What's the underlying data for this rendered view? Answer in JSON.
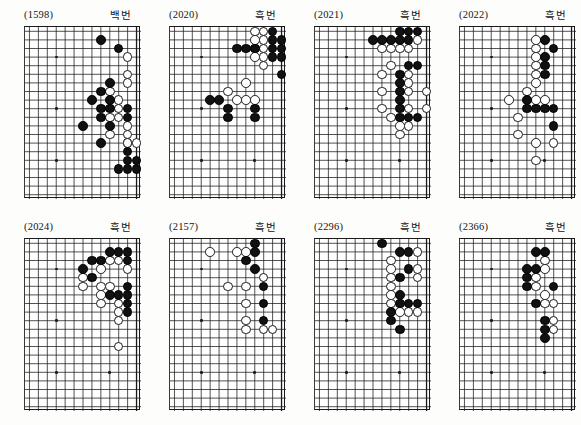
{
  "page": {
    "background_color": "#fdfdfc",
    "black_stone_color": "#111111",
    "white_stone_color": "#ffffff",
    "line_color": "#1a1a1a",
    "columns": 4,
    "rows": 2
  },
  "board_spec": {
    "cols": 13,
    "rows": 20,
    "cell_px": 8.92,
    "stone_diameter_px": 9.6,
    "note": "Right-side fragment of a 19x19 go board; column 13 is the right edge line."
  },
  "panels": [
    {
      "id": "(1598)",
      "turn": "백번",
      "turn_meaning": "white-to-play",
      "star_points": [
        [
          3,
          3
        ],
        [
          3,
          9
        ],
        [
          3,
          15
        ]
      ],
      "black": [
        [
          8,
          1
        ],
        [
          10,
          2
        ],
        [
          9,
          6
        ],
        [
          8,
          7
        ],
        [
          7,
          8
        ],
        [
          9,
          8
        ],
        [
          8,
          9
        ],
        [
          9,
          9
        ],
        [
          11,
          9
        ],
        [
          8,
          10
        ],
        [
          11,
          10
        ],
        [
          6,
          11
        ],
        [
          9,
          11
        ],
        [
          8,
          13
        ],
        [
          11,
          14
        ],
        [
          11,
          15
        ],
        [
          12,
          15
        ],
        [
          10,
          16
        ],
        [
          11,
          16
        ],
        [
          12,
          16
        ]
      ],
      "white": [
        [
          11,
          3
        ],
        [
          11,
          5
        ],
        [
          11,
          6
        ],
        [
          9,
          7
        ],
        [
          10,
          8
        ],
        [
          10,
          9
        ],
        [
          9,
          10
        ],
        [
          10,
          10
        ],
        [
          11,
          11
        ],
        [
          9,
          12
        ],
        [
          11,
          12
        ],
        [
          11,
          13
        ],
        [
          12,
          13
        ],
        [
          11,
          13
        ]
      ]
    },
    {
      "id": "(2020)",
      "turn": "흑번",
      "turn_meaning": "black-to-play",
      "star_points": [
        [
          3,
          3
        ],
        [
          3,
          9
        ],
        [
          3,
          15
        ],
        [
          9,
          15
        ]
      ],
      "black": [
        [
          11,
          0
        ],
        [
          11,
          1
        ],
        [
          12,
          1
        ],
        [
          7,
          2
        ],
        [
          8,
          2
        ],
        [
          9,
          2
        ],
        [
          11,
          2
        ],
        [
          12,
          2
        ],
        [
          11,
          3
        ],
        [
          12,
          3
        ],
        [
          12,
          5
        ],
        [
          4,
          8
        ],
        [
          5,
          8
        ],
        [
          6,
          9
        ],
        [
          6,
          10
        ],
        [
          9,
          9
        ],
        [
          9,
          10
        ]
      ],
      "white": [
        [
          9,
          0
        ],
        [
          10,
          0
        ],
        [
          9,
          1
        ],
        [
          10,
          1
        ],
        [
          9,
          2
        ],
        [
          10,
          2
        ],
        [
          9,
          3
        ],
        [
          10,
          3
        ],
        [
          10,
          4
        ],
        [
          8,
          6
        ],
        [
          6,
          7
        ],
        [
          7,
          8
        ],
        [
          8,
          8
        ],
        [
          9,
          8
        ]
      ]
    },
    {
      "id": "(2021)",
      "turn": "흑번",
      "turn_meaning": "black-to-play",
      "star_points": [
        [
          3,
          3
        ],
        [
          3,
          9
        ],
        [
          3,
          15
        ],
        [
          9,
          15
        ]
      ],
      "black": [
        [
          9,
          0
        ],
        [
          10,
          0
        ],
        [
          11,
          0
        ],
        [
          6,
          1
        ],
        [
          7,
          1
        ],
        [
          8,
          1
        ],
        [
          9,
          1
        ],
        [
          10,
          1
        ],
        [
          10,
          4
        ],
        [
          11,
          4
        ],
        [
          9,
          5
        ],
        [
          9,
          6
        ],
        [
          9,
          7
        ],
        [
          9,
          8
        ],
        [
          9,
          9
        ],
        [
          9,
          10
        ],
        [
          10,
          10
        ],
        [
          11,
          10
        ]
      ],
      "white": [
        [
          11,
          1
        ],
        [
          7,
          2
        ],
        [
          8,
          2
        ],
        [
          9,
          2
        ],
        [
          10,
          2
        ],
        [
          8,
          4
        ],
        [
          7,
          5
        ],
        [
          10,
          5
        ],
        [
          10,
          6
        ],
        [
          7,
          7
        ],
        [
          10,
          7
        ],
        [
          12,
          7
        ],
        [
          7,
          9
        ],
        [
          10,
          9
        ],
        [
          12,
          9
        ],
        [
          8,
          10
        ],
        [
          9,
          11
        ],
        [
          10,
          11
        ],
        [
          9,
          12
        ]
      ]
    },
    {
      "id": "(2022)",
      "turn": "흑번",
      "turn_meaning": "black-to-play",
      "star_points": [
        [
          3,
          3
        ],
        [
          3,
          9
        ],
        [
          3,
          15
        ],
        [
          9,
          15
        ]
      ],
      "black": [
        [
          9,
          1
        ],
        [
          10,
          2
        ],
        [
          9,
          3
        ],
        [
          9,
          4
        ],
        [
          9,
          5
        ],
        [
          7,
          8
        ],
        [
          7,
          9
        ],
        [
          8,
          9
        ],
        [
          9,
          9
        ],
        [
          10,
          9
        ],
        [
          10,
          11
        ]
      ],
      "white": [
        [
          8,
          1
        ],
        [
          8,
          2
        ],
        [
          8,
          3
        ],
        [
          8,
          4
        ],
        [
          8,
          5
        ],
        [
          8,
          6
        ],
        [
          7,
          7
        ],
        [
          5,
          8
        ],
        [
          8,
          8
        ],
        [
          9,
          8
        ],
        [
          6,
          10
        ],
        [
          6,
          12
        ],
        [
          8,
          13
        ],
        [
          10,
          13
        ],
        [
          8,
          15
        ]
      ]
    },
    {
      "id": "(2024)",
      "turn": "흑번",
      "turn_meaning": "black-to-play",
      "star_points": [
        [
          3,
          3
        ],
        [
          3,
          9
        ],
        [
          3,
          15
        ],
        [
          9,
          15
        ]
      ],
      "black": [
        [
          9,
          1
        ],
        [
          10,
          1
        ],
        [
          11,
          1
        ],
        [
          7,
          2
        ],
        [
          8,
          2
        ],
        [
          11,
          2
        ],
        [
          6,
          3
        ],
        [
          7,
          4
        ],
        [
          11,
          5
        ],
        [
          9,
          6
        ],
        [
          10,
          6
        ],
        [
          11,
          6
        ],
        [
          11,
          7
        ],
        [
          11,
          8
        ]
      ],
      "white": [
        [
          9,
          2
        ],
        [
          6,
          4
        ],
        [
          8,
          3
        ],
        [
          10,
          2
        ],
        [
          11,
          3
        ],
        [
          6,
          5
        ],
        [
          8,
          5
        ],
        [
          9,
          5
        ],
        [
          8,
          6
        ],
        [
          8,
          7
        ],
        [
          10,
          7
        ],
        [
          10,
          8
        ],
        [
          10,
          9
        ],
        [
          10,
          12
        ]
      ]
    },
    {
      "id": "(2157)",
      "turn": "흑번",
      "turn_meaning": "black-to-play",
      "star_points": [
        [
          3,
          3
        ],
        [
          3,
          9
        ],
        [
          3,
          15
        ],
        [
          9,
          15
        ]
      ],
      "black": [
        [
          9,
          0
        ],
        [
          9,
          1
        ],
        [
          8,
          2
        ],
        [
          9,
          3
        ],
        [
          10,
          5
        ],
        [
          10,
          7
        ],
        [
          10,
          9
        ]
      ],
      "white": [
        [
          4,
          1
        ],
        [
          7,
          1
        ],
        [
          8,
          1
        ],
        [
          6,
          5
        ],
        [
          8,
          5
        ],
        [
          10,
          4
        ],
        [
          8,
          7
        ],
        [
          8,
          9
        ],
        [
          8,
          10
        ],
        [
          10,
          10
        ],
        [
          11,
          10
        ]
      ]
    },
    {
      "id": "(2296)",
      "turn": "흑번",
      "turn_meaning": "black-to-play",
      "star_points": [
        [
          3,
          3
        ],
        [
          3,
          9
        ],
        [
          3,
          15
        ],
        [
          9,
          15
        ]
      ],
      "black": [
        [
          7,
          0
        ],
        [
          9,
          1
        ],
        [
          10,
          1
        ],
        [
          10,
          3
        ],
        [
          9,
          4
        ],
        [
          9,
          6
        ],
        [
          9,
          7
        ],
        [
          10,
          7
        ],
        [
          11,
          7
        ],
        [
          8,
          8
        ],
        [
          8,
          9
        ],
        [
          9,
          10
        ]
      ],
      "white": [
        [
          11,
          1
        ],
        [
          8,
          2
        ],
        [
          8,
          3
        ],
        [
          11,
          3
        ],
        [
          8,
          4
        ],
        [
          11,
          4
        ],
        [
          8,
          5
        ],
        [
          8,
          6
        ],
        [
          8,
          7
        ],
        [
          9,
          8
        ],
        [
          10,
          8
        ],
        [
          11,
          8
        ]
      ]
    },
    {
      "id": "(2366)",
      "turn": "흑번",
      "turn_meaning": "black-to-play",
      "star_points": [
        [
          3,
          3
        ],
        [
          3,
          9
        ],
        [
          3,
          15
        ],
        [
          9,
          15
        ]
      ],
      "black": [
        [
          8,
          1
        ],
        [
          9,
          1
        ],
        [
          7,
          3
        ],
        [
          8,
          3
        ],
        [
          7,
          4
        ],
        [
          7,
          5
        ],
        [
          10,
          5
        ],
        [
          8,
          7
        ],
        [
          9,
          9
        ],
        [
          9,
          10
        ],
        [
          9,
          11
        ]
      ],
      "white": [
        [
          9,
          2
        ],
        [
          9,
          3
        ],
        [
          8,
          4
        ],
        [
          8,
          5
        ],
        [
          9,
          6
        ],
        [
          9,
          7
        ],
        [
          10,
          7
        ],
        [
          10,
          9
        ],
        [
          10,
          10
        ]
      ]
    }
  ]
}
